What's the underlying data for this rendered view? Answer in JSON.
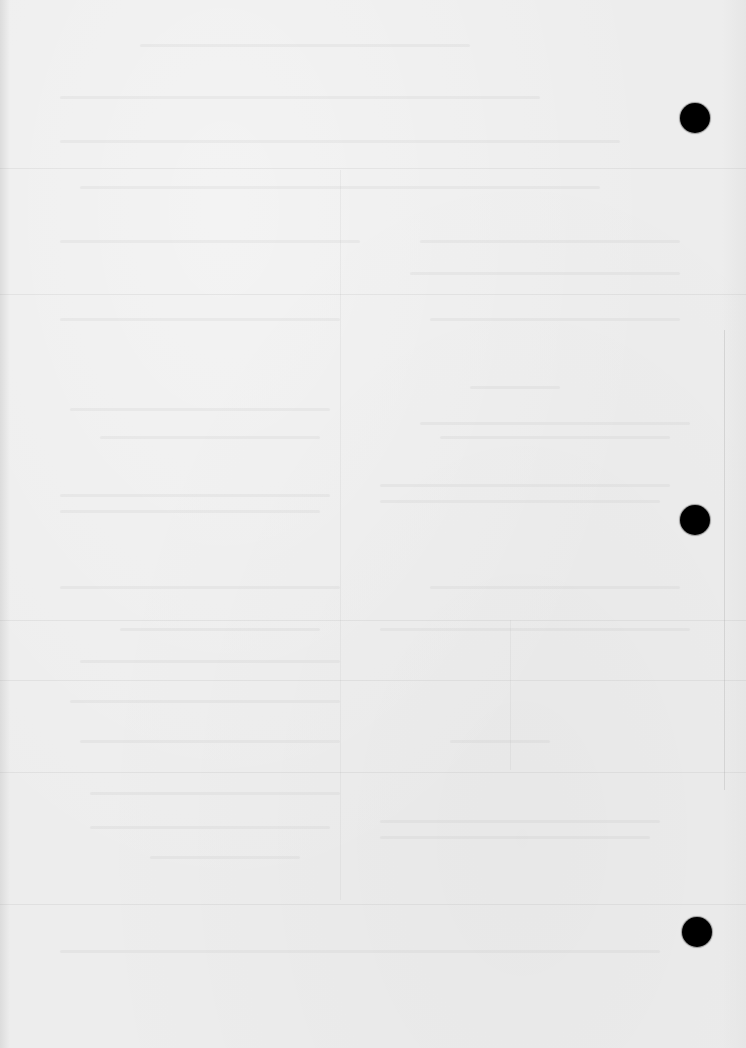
{
  "document": {
    "type": "scanned-page",
    "content_state": "blank (reverse-side bleed-through only, illegible)",
    "paper_color": "#ededed",
    "punch_holes": [
      {
        "cx": 695,
        "cy": 118,
        "diameter": 30
      },
      {
        "cx": 695,
        "cy": 520,
        "diameter": 30
      },
      {
        "cx": 697,
        "cy": 932,
        "diameter": 30
      }
    ],
    "punch_hole_color": "#000000"
  }
}
